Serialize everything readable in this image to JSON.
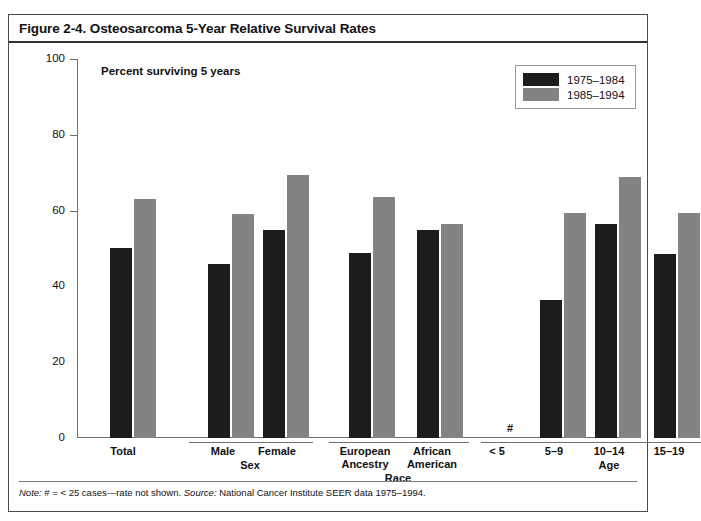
{
  "figure": {
    "title": "Figure 2-4. Osteosarcoma 5-Year Relative Survival Rates",
    "axis_note": "Percent surviving 5 years",
    "footnote_note_label": "Note:",
    "footnote_note_text": " # = < 25 cases—rate not shown. ",
    "footnote_source_label": "Source:",
    "footnote_source_text": " National Cancer Institute SEER data 1975–1994.",
    "missing_marker": "#"
  },
  "legend": {
    "position": "top-right",
    "items": [
      {
        "label": "1975–1984",
        "color": "#1c1c1c"
      },
      {
        "label": "1985–1994",
        "color": "#838383"
      }
    ]
  },
  "groups": [
    {
      "label": ""
    },
    {
      "label": "Sex"
    },
    {
      "label": "Race"
    },
    {
      "label": "Age"
    }
  ],
  "chart_data": {
    "type": "bar",
    "title": "Figure 2-4. Osteosarcoma 5-Year Relative Survival Rates",
    "xlabel": "",
    "ylabel": "Percent surviving 5 years",
    "ylim": [
      0,
      100
    ],
    "yticks": [
      0,
      20,
      40,
      60,
      80,
      100
    ],
    "grid": false,
    "categories": [
      "Total",
      "Male",
      "Female",
      "European Ancestry",
      "African American",
      "< 5",
      "5–9",
      "10–14",
      "15–19"
    ],
    "category_groups": [
      "",
      "Sex",
      "Sex",
      "Race",
      "Race",
      "Age",
      "Age",
      "Age",
      "Age"
    ],
    "series": [
      {
        "name": "1975–1984",
        "color": "#1c1c1c",
        "values": [
          50.2,
          46.0,
          55.0,
          48.8,
          54.8,
          null,
          36.5,
          56.5,
          48.5
        ]
      },
      {
        "name": "1985–1994",
        "color": "#838383",
        "values": [
          63.0,
          59.0,
          69.5,
          63.5,
          56.5,
          null,
          59.5,
          69.0,
          59.5
        ]
      }
    ],
    "annotations": [
      {
        "category": "< 5",
        "text": "#",
        "meaning": "< 25 cases—rate not shown"
      }
    ]
  },
  "yticklabels": [
    "100",
    "80",
    "60",
    "40",
    "20",
    "0"
  ]
}
